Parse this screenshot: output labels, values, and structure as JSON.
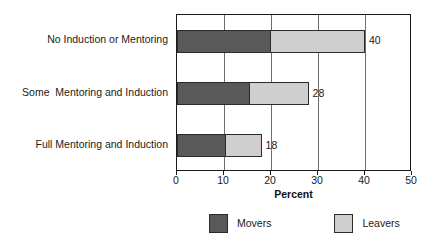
{
  "chart_data": {
    "type": "bar",
    "orientation": "horizontal",
    "stacked": true,
    "title": "",
    "xlabel": "Percent",
    "ylabel": "",
    "xlim": [
      0,
      50
    ],
    "xticks": [
      0,
      10,
      20,
      30,
      40,
      50
    ],
    "xtick_labels": [
      "0",
      "10",
      "20",
      "30",
      "40",
      "50"
    ],
    "grid": true,
    "grid_axis": "x",
    "legend_position": "bottom",
    "categories": [
      "No Induction or Mentoring",
      "Some  Mentoring and Induction",
      "Full Mentoring and Induction"
    ],
    "series": [
      {
        "name": "Movers",
        "color": "#595959",
        "values": [
          20,
          15.5,
          10.5
        ]
      },
      {
        "name": "Leavers",
        "color": "#cfcfcf",
        "values": [
          20,
          12.5,
          7.5
        ]
      }
    ],
    "totals": [
      40,
      28,
      18
    ],
    "total_labels": [
      "40",
      "28",
      "18"
    ]
  },
  "colors": {
    "movers": "#595959",
    "leavers": "#cfcfcf",
    "axis": "#1a1a1a",
    "grid": "#6e6e6e",
    "background": "#ffffff",
    "text": "#1a1a1a"
  },
  "axis": {
    "x_title": "Percent",
    "ticks": [
      "0",
      "10",
      "20",
      "30",
      "40",
      "50"
    ]
  },
  "legend": {
    "entries": [
      {
        "label": "Movers",
        "color": "#595959"
      },
      {
        "label": "Leavers",
        "color": "#cfcfcf"
      }
    ]
  }
}
